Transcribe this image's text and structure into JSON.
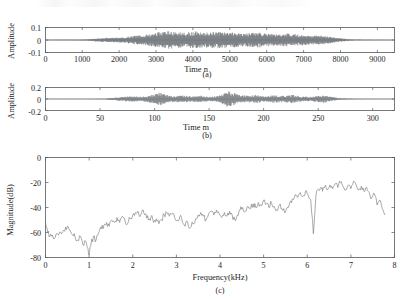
{
  "figure": {
    "background": "#ffffff",
    "line_color": "#6a6f73",
    "axis_color": "#555a5e",
    "text_color": "#1d1d1d"
  },
  "panels": [
    {
      "id": "panel-a",
      "caption": "(a)",
      "ylabel": "Amplitude",
      "xlabel": "Time n",
      "yticks": [
        "0.1",
        "0",
        "-0.1"
      ],
      "ytick_values": [
        0.1,
        0,
        -0.1
      ],
      "xticks": [
        "0",
        "1000",
        "2000",
        "3000",
        "4000",
        "5000",
        "6000",
        "7000",
        "8000",
        "9000"
      ],
      "xtick_values": [
        0,
        1000,
        2000,
        3000,
        4000,
        5000,
        6000,
        7000,
        8000,
        9000
      ],
      "xlim": [
        0,
        9450
      ],
      "ylim": [
        -0.13,
        0.13
      ]
    },
    {
      "id": "panel-b",
      "caption": "(b)",
      "ylabel": "Amplitude",
      "xlabel": "Time m",
      "yticks": [
        "0.2",
        "0",
        "-0.2"
      ],
      "ytick_values": [
        0.2,
        0,
        -0.2
      ],
      "xticks": [
        "0",
        "50",
        "100",
        "150",
        "200",
        "250",
        "300"
      ],
      "xtick_values": [
        0,
        50,
        100,
        150,
        200,
        250,
        300
      ],
      "xlim": [
        0,
        320
      ],
      "ylim": [
        -0.26,
        0.26
      ]
    },
    {
      "id": "panel-c",
      "caption": "(c)",
      "ylabel": "Magnitude(dB)",
      "xlabel": "Frequency(kHz)",
      "yticks": [
        "0",
        "-20",
        "-40",
        "-60",
        "-80"
      ],
      "ytick_values": [
        0,
        -20,
        -40,
        -60,
        -80
      ],
      "xticks": [
        "0",
        "1",
        "2",
        "3",
        "4",
        "5",
        "6",
        "7",
        "8"
      ],
      "xtick_values": [
        0,
        1,
        2,
        3,
        4,
        5,
        6,
        7,
        8
      ],
      "xlim": [
        0,
        8
      ],
      "ylim": [
        -80,
        0
      ]
    }
  ],
  "chart_data": [
    {
      "type": "line",
      "id": "panel-a-waveform",
      "title": "(a)",
      "xlabel": "Time n",
      "ylabel": "Amplitude",
      "xlim": [
        0,
        9450
      ],
      "ylim": [
        -0.13,
        0.13
      ],
      "grid": false,
      "legend": null,
      "description": "Speech time-domain waveform, dense oscillation envelope; near-silence before sample 1150 and after sample 8350, peak amplitude about 0.1",
      "envelope_x": [
        0,
        400,
        900,
        1150,
        1350,
        1600,
        1900,
        2150,
        2400,
        2650,
        2900,
        3100,
        3300,
        3550,
        3800,
        4050,
        4300,
        4550,
        4800,
        5050,
        5300,
        5550,
        5800,
        6050,
        6300,
        6550,
        6800,
        7050,
        7300,
        7550,
        7800,
        8050,
        8250,
        8400,
        8800,
        9450
      ],
      "envelope_y": [
        0.004,
        0.004,
        0.005,
        0.008,
        0.016,
        0.022,
        0.026,
        0.032,
        0.047,
        0.055,
        0.072,
        0.085,
        0.097,
        0.09,
        0.082,
        0.093,
        0.08,
        0.086,
        0.092,
        0.083,
        0.07,
        0.074,
        0.082,
        0.069,
        0.061,
        0.072,
        0.062,
        0.055,
        0.05,
        0.044,
        0.03,
        0.016,
        0.008,
        0.005,
        0.004,
        0.004
      ]
    },
    {
      "type": "line",
      "id": "panel-b-waveform",
      "title": "(b)",
      "xlabel": "Time m",
      "ylabel": "Amplitude",
      "xlim": [
        0,
        320
      ],
      "ylim": [
        -0.26,
        0.26
      ],
      "grid": false,
      "legend": null,
      "description": "Decimated/residual waveform with impulsive bursts; strongest bursts near m=105 and m=167, quiet after m=265",
      "envelope_x": [
        0,
        20,
        40,
        55,
        62,
        70,
        78,
        86,
        94,
        100,
        105,
        110,
        118,
        126,
        134,
        142,
        150,
        158,
        163,
        167,
        172,
        178,
        186,
        194,
        202,
        210,
        218,
        226,
        234,
        242,
        250,
        256,
        262,
        270,
        285,
        300,
        320
      ],
      "envelope_y": [
        0.004,
        0.004,
        0.005,
        0.012,
        0.03,
        0.05,
        0.068,
        0.055,
        0.075,
        0.12,
        0.16,
        0.1,
        0.07,
        0.09,
        0.062,
        0.08,
        0.055,
        0.075,
        0.14,
        0.2,
        0.15,
        0.095,
        0.085,
        0.1,
        0.065,
        0.09,
        0.075,
        0.1,
        0.06,
        0.05,
        0.075,
        0.09,
        0.05,
        0.02,
        0.008,
        0.006,
        0.004
      ]
    },
    {
      "type": "line",
      "id": "panel-c-spectrum",
      "title": "(c)",
      "xlabel": "Frequency(kHz)",
      "ylabel": "Magnitude(dB)",
      "xlim": [
        0,
        8
      ],
      "ylim": [
        -80,
        0
      ],
      "grid": false,
      "legend": null,
      "description": "Magnitude spectrum rising from about -60 dB at low frequency to about -20 dB near 7 kHz; deep notch near 1.0 kHz reaching -78 dB and a sharp notch near 6.35 kHz reaching -61 dB",
      "x": [
        0.0,
        0.05,
        0.1,
        0.16,
        0.22,
        0.3,
        0.37,
        0.44,
        0.5,
        0.56,
        0.62,
        0.68,
        0.74,
        0.8,
        0.86,
        0.92,
        0.96,
        1.0,
        1.04,
        1.1,
        1.16,
        1.22,
        1.28,
        1.34,
        1.4,
        1.46,
        1.52,
        1.58,
        1.64,
        1.7,
        1.76,
        1.82,
        1.88,
        1.94,
        2.0,
        2.06,
        2.12,
        2.18,
        2.24,
        2.3,
        2.36,
        2.42,
        2.48,
        2.54,
        2.6,
        2.66,
        2.72,
        2.78,
        2.84,
        2.9,
        2.96,
        3.02,
        3.08,
        3.14,
        3.2,
        3.26,
        3.32,
        3.38,
        3.44,
        3.5,
        3.56,
        3.62,
        3.68,
        3.74,
        3.8,
        3.86,
        3.92,
        3.98,
        4.04,
        4.1,
        4.16,
        4.22,
        4.28,
        4.34,
        4.4,
        4.46,
        4.52,
        4.58,
        4.64,
        4.7,
        4.76,
        4.82,
        4.88,
        4.94,
        5.0,
        5.06,
        5.12,
        5.18,
        5.24,
        5.3,
        5.36,
        5.42,
        5.48,
        5.54,
        5.6,
        5.66,
        5.72,
        5.78,
        5.84,
        5.9,
        5.96,
        6.02,
        6.08,
        6.14,
        6.2,
        6.26,
        6.32,
        6.35,
        6.4,
        6.46,
        6.52,
        6.58,
        6.64,
        6.7,
        6.76,
        6.82,
        6.88,
        6.94,
        7.0,
        7.06,
        7.12,
        7.18,
        7.24,
        7.3,
        7.36,
        7.42,
        7.48,
        7.54,
        7.6,
        7.66,
        7.72,
        7.78,
        7.84,
        7.9,
        7.95,
        8.0
      ],
      "y": [
        -52,
        -60,
        -63,
        -62,
        -64,
        -62,
        -61,
        -59,
        -55,
        -58,
        -62,
        -64,
        -66,
        -63,
        -70,
        -67,
        -72,
        -78,
        -70,
        -63,
        -66,
        -60,
        -57,
        -54,
        -52,
        -55,
        -50,
        -52,
        -48,
        -52,
        -47,
        -50,
        -53,
        -49,
        -46,
        -44,
        -43,
        -46,
        -42,
        -45,
        -50,
        -47,
        -52,
        -49,
        -53,
        -50,
        -46,
        -44,
        -47,
        -45,
        -48,
        -50,
        -47,
        -52,
        -55,
        -52,
        -56,
        -53,
        -49,
        -46,
        -44,
        -47,
        -50,
        -45,
        -43,
        -46,
        -42,
        -45,
        -48,
        -44,
        -47,
        -43,
        -46,
        -50,
        -46,
        -42,
        -40,
        -43,
        -39,
        -41,
        -37,
        -40,
        -36,
        -38,
        -34,
        -37,
        -40,
        -36,
        -39,
        -42,
        -38,
        -41,
        -44,
        -40,
        -36,
        -33,
        -30,
        -32,
        -28,
        -31,
        -27,
        -30,
        -34,
        -61,
        -30,
        -26,
        -24,
        -27,
        -23,
        -26,
        -22,
        -25,
        -21,
        -24,
        -20,
        -23,
        -26,
        -22,
        -25,
        -19,
        -22,
        -26,
        -23,
        -27,
        -24,
        -28,
        -32,
        -29,
        -38,
        -34,
        -41,
        -46
      ]
    }
  ]
}
